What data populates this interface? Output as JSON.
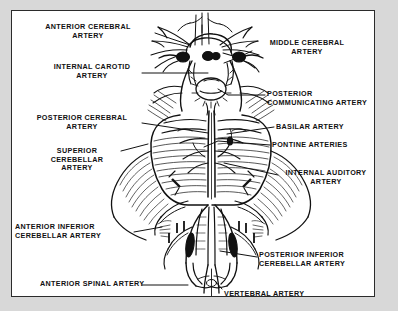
{
  "figure": {
    "frame_color": "#2b2b2b",
    "page_background": "#d8d8d8",
    "figure_background": "#ffffff",
    "ink_color": "#111111"
  },
  "labels": [
    {
      "id": "anterior-cerebral-artery",
      "text": "ANTERIOR CEREBRAL\nARTERY",
      "side": "left",
      "align": "center",
      "x": 57,
      "y": 12,
      "lines": 2
    },
    {
      "id": "internal-carotid-artery",
      "text": "INTERNAL CAROTID\nARTERY",
      "side": "left",
      "align": "center",
      "x": 60,
      "y": 52,
      "lines": 2
    },
    {
      "id": "posterior-cerebral-artery",
      "text": "POSTERIOR CEREBRAL\nARTERY",
      "side": "left",
      "align": "center",
      "x": 50,
      "y": 103,
      "lines": 2
    },
    {
      "id": "superior-cerebellar-artery",
      "text": "SUPERIOR\nCEREBELLAR\nARTERY",
      "side": "left",
      "align": "center",
      "x": 57,
      "y": 136,
      "lines": 3
    },
    {
      "id": "anterior-inferior-cerebellar-artery",
      "text": "ANTERIOR INFERIOR\nCEREBELLAR ARTERY",
      "side": "left",
      "align": "left",
      "x": 8,
      "y": 212,
      "lines": 2
    },
    {
      "id": "anterior-spinal-artery",
      "text": "ANTERIOR SPINAL ARTERY",
      "side": "left",
      "align": "left",
      "x": 33,
      "y": 268,
      "lines": 1
    },
    {
      "id": "middle-cerebral-artery",
      "text": "MIDDLE CEREBRAL\nARTERY",
      "side": "right",
      "align": "center",
      "x": 243,
      "y": 28,
      "lines": 2
    },
    {
      "id": "posterior-communicating-artery",
      "text": "POSTERIOR\nCOMMUNICATING ARTERY",
      "side": "right",
      "align": "left",
      "x": 256,
      "y": 79,
      "lines": 2
    },
    {
      "id": "basilar-artery",
      "text": "BASILAR ARTERY",
      "side": "right",
      "align": "left",
      "x": 265,
      "y": 112,
      "lines": 1
    },
    {
      "id": "pontine-arteries",
      "text": "PONTINE ARTERIES",
      "side": "right",
      "align": "left",
      "x": 261,
      "y": 130,
      "lines": 1
    },
    {
      "id": "internal-auditory-artery",
      "text": "INTERNAL AUDITORY\nARTERY",
      "side": "right",
      "align": "center",
      "x": 270,
      "y": 158,
      "lines": 2
    },
    {
      "id": "posterior-inferior-cerebellar-artery",
      "text": "POSTERIOR INFERIOR\nCEREBELLAR ARTERY",
      "side": "right",
      "align": "left",
      "x": 248,
      "y": 240,
      "lines": 2
    },
    {
      "id": "vertebral-artery",
      "text": "VERTEBRAL ARTERY",
      "side": "right",
      "align": "left",
      "x": 213,
      "y": 279,
      "lines": 1
    }
  ],
  "leaders": [
    {
      "id": "leader-anterior-cerebral",
      "points": "143,22 160,28 178,34"
    },
    {
      "id": "leader-internal-carotid",
      "points": "130,62 196,62"
    },
    {
      "id": "leader-posterior-cerebral",
      "points": "130,112 196,122"
    },
    {
      "id": "leader-superior-cerebellar",
      "points": "109,140 136,133"
    },
    {
      "id": "leader-anterior-inf-cereb",
      "points": "122,221 150,216"
    },
    {
      "id": "leader-anterior-spinal",
      "points": "130,274 176,274"
    },
    {
      "id": "leader-middle-cerebral",
      "points": "240,40 225,47 212,52"
    },
    {
      "id": "leader-post-communicating",
      "points": "253,84 216,84 206,78"
    },
    {
      "id": "leader-basilar",
      "points": "262,116 215,123"
    },
    {
      "id": "leader-pontine",
      "points": "258,134 206,130 192,136"
    },
    {
      "id": "leader-internal-auditory",
      "points": "266,164 212,152"
    },
    {
      "id": "leader-post-inf-cereb",
      "points": "245,246 208,240"
    },
    {
      "id": "leader-vertebral",
      "points": "210,278 203,270"
    }
  ]
}
